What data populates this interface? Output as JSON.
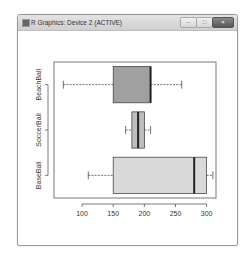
{
  "window": {
    "title": "R Graphics: Device 2 (ACTIVE)",
    "controls": {
      "minimize": "–",
      "maximize": "□",
      "close": "×"
    }
  },
  "chart_data": {
    "type": "boxplot",
    "orientation": "horizontal",
    "title": "",
    "xlabel": "",
    "ylabel": "",
    "xlim": [
      55,
      315
    ],
    "x_ticks": [
      100,
      150,
      200,
      250,
      300
    ],
    "categories": [
      "BaseBall",
      "SoccerBall",
      "BeachBall"
    ],
    "series": [
      {
        "name": "BaseBall",
        "whisker_low": 110,
        "q1": 150,
        "median": 280,
        "q3": 300,
        "whisker_high": 310,
        "fill": "#d9d9d9"
      },
      {
        "name": "SoccerBall",
        "whisker_low": 170,
        "q1": 180,
        "median": 190,
        "q3": 200,
        "whisker_high": 210,
        "fill": "#bdbdbd"
      },
      {
        "name": "BeachBall",
        "whisker_low": 70,
        "q1": 150,
        "median": 210,
        "q3": 210,
        "whisker_high": 260,
        "fill": "#a0a0a0"
      }
    ],
    "grid": false,
    "legend": "none"
  }
}
